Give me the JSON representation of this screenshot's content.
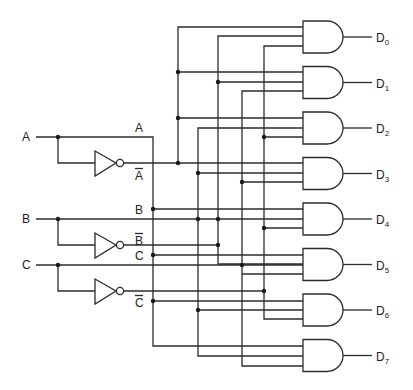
{
  "diagram": {
    "inputs": [
      {
        "label": "A",
        "y": 137,
        "inv_y": 163,
        "inv_label": "A",
        "bus_x": 153,
        "inv_bus_x": 178
      },
      {
        "label": "B",
        "y": 219,
        "inv_y": 245,
        "inv_label": "B",
        "bus_x": 198,
        "inv_bus_x": 218
      },
      {
        "label": "C",
        "y": 265,
        "inv_y": 291,
        "inv_label": "C",
        "bus_x": 242,
        "inv_bus_x": 264
      }
    ],
    "bus_labels": {
      "a": "A",
      "a_bar": "A",
      "b": "B",
      "b_bar": "B",
      "c": "C",
      "c_bar": "C"
    },
    "outputs": [
      {
        "label": "D",
        "sub": "0",
        "terms": "A' B' C'"
      },
      {
        "label": "D",
        "sub": "1",
        "terms": "A' B' C"
      },
      {
        "label": "D",
        "sub": "2",
        "terms": "A' B C'"
      },
      {
        "label": "D",
        "sub": "3",
        "terms": "A' B C"
      },
      {
        "label": "D",
        "sub": "4",
        "terms": "A B C'"
      },
      {
        "label": "D",
        "sub": "5",
        "terms": "A B' C"
      },
      {
        "label": "D",
        "sub": "6",
        "terms": "A B C'"
      },
      {
        "label": "D",
        "sub": "7",
        "terms": "A B C"
      }
    ],
    "colors": {
      "line": "#2b2b2b",
      "background": "#ffffff"
    }
  }
}
